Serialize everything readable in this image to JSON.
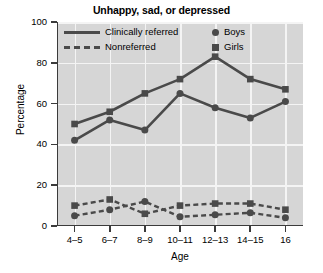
{
  "chart_data": {
    "type": "line",
    "title": "Unhappy, sad, or depressed",
    "xlabel": "Age",
    "ylabel": "Percentage",
    "categories": [
      "4–5",
      "6–7",
      "8–9",
      "10–11",
      "12–13",
      "14–15",
      "16"
    ],
    "ylim": [
      0,
      100
    ],
    "yticks": [
      0,
      20,
      40,
      60,
      80,
      100
    ],
    "ytick_labels": [
      "0",
      "20",
      "40",
      "60",
      "80",
      "100"
    ],
    "grid": true,
    "legend_position": "top-inside",
    "series": [
      {
        "name": "Clinically referred – Girls",
        "group": "Clinically referred",
        "marker": "square",
        "line_style": "solid",
        "color": "#4a4a4a",
        "values": [
          50,
          56,
          65,
          72,
          83,
          72,
          67
        ]
      },
      {
        "name": "Clinically referred – Boys",
        "group": "Clinically referred",
        "marker": "circle",
        "line_style": "solid",
        "color": "#4a4a4a",
        "values": [
          42,
          52,
          47,
          65,
          58,
          53,
          61
        ]
      },
      {
        "name": "Nonreferred – Girls",
        "group": "Nonreferred",
        "marker": "square",
        "line_style": "dashed",
        "color": "#4a4a4a",
        "values": [
          10,
          13,
          6,
          10,
          11,
          11,
          8
        ]
      },
      {
        "name": "Nonreferred – Boys",
        "group": "Nonreferred",
        "marker": "circle",
        "line_style": "dashed",
        "color": "#4a4a4a",
        "values": [
          5,
          8,
          12,
          4.5,
          5.5,
          6.5,
          4
        ]
      }
    ],
    "legend": {
      "line_entries": [
        {
          "label": "Clinically referred",
          "style": "solid"
        },
        {
          "label": "Nonreferred",
          "style": "dashed"
        }
      ],
      "marker_entries": [
        {
          "label": "Boys",
          "marker": "circle"
        },
        {
          "label": "Girls",
          "marker": "square"
        }
      ]
    },
    "colors": {
      "plot_background": "#d6d6d6",
      "gridline": "#f4f4f4",
      "axis": "#3b3b3b",
      "series": "#4a4a4a",
      "text": "#000000",
      "figure_background": "#ffffff"
    }
  }
}
